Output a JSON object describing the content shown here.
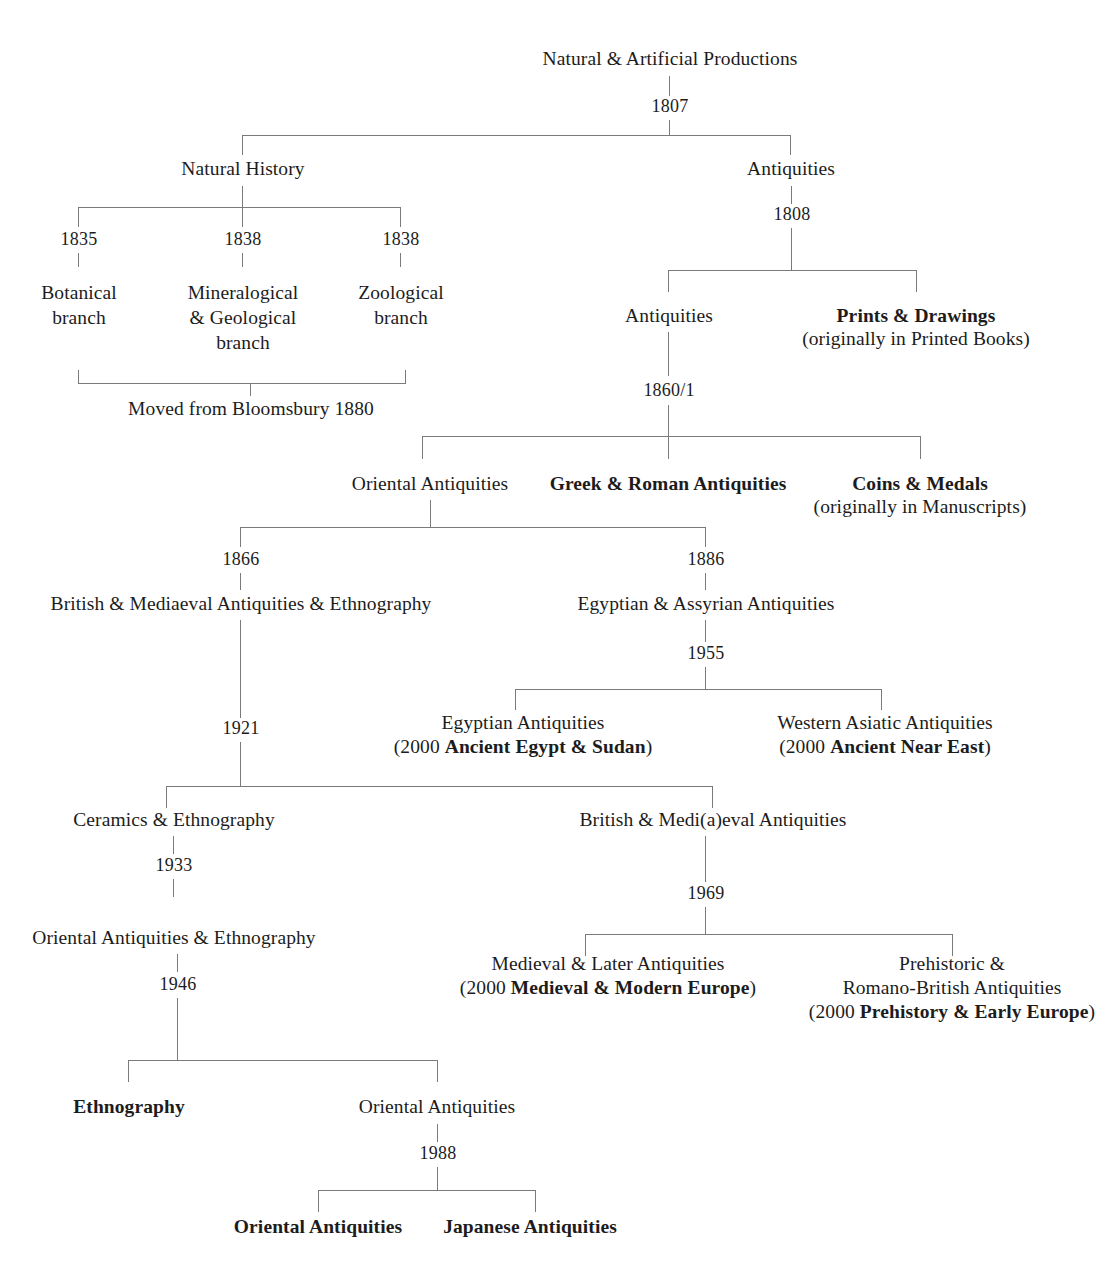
{
  "diagram": {
    "line_color": "#7a7a7a",
    "text_color": "#1c1c1c",
    "background": "#ffffff",
    "nodes": {
      "root": "Natural & Artificial Productions",
      "natural_history": "Natural History",
      "antiquities_1807": "Antiquities",
      "botanical": "Botanical\nbranch",
      "botanical_l1": "Botanical",
      "botanical_l2": "branch",
      "mineralogical_l1": "Mineralogical",
      "mineralogical_l2": "& Geological",
      "mineralogical_l3": "branch",
      "zoological_l1": "Zoological",
      "zoological_l2": "branch",
      "moved_bloomsbury": "Moved from Bloomsbury 1880",
      "antiquities_1808": "Antiquities",
      "prints_drawings": "Prints & Drawings",
      "prints_drawings_sub": "(originally in Printed Books)",
      "oriental_antiquities_1860": "Oriental Antiquities",
      "greek_roman": "Greek & Roman Antiquities",
      "coins_medals": "Coins & Medals",
      "coins_medals_sub": "(originally in Manuscripts)",
      "british_mediaeval_ethno": "British & Mediaeval Antiquities & Ethnography",
      "egyptian_assyrian": "Egyptian & Assyrian Antiquities",
      "egyptian_antiquities": "Egyptian Antiquities",
      "egyptian_antiquities_sub_pre": "(2000 ",
      "egyptian_antiquities_sub_bold": "Ancient Egypt & Sudan",
      "egyptian_antiquities_sub_post": ")",
      "western_asiatic": "Western Asiatic Antiquities",
      "western_asiatic_sub_pre": "(2000 ",
      "western_asiatic_sub_bold": "Ancient Near East",
      "western_asiatic_sub_post": ")",
      "ceramics_ethno": "Ceramics & Ethnography",
      "british_medieval": "British & Medi(a)eval Antiquities",
      "oriental_ethno": "Oriental Antiquities & Ethnography",
      "medieval_later": "Medieval & Later Antiquities",
      "medieval_later_sub_pre": "(2000 ",
      "medieval_later_sub_bold": "Medieval & Modern Europe",
      "medieval_later_sub_post": ")",
      "prehistoric_l1": "Prehistoric &",
      "prehistoric_l2": "Romano-British Antiquities",
      "prehistoric_sub_pre": "(2000 ",
      "prehistoric_sub_bold": "Prehistory & Early Europe",
      "prehistoric_sub_post": ")",
      "ethnography": "Ethnography",
      "oriental_antiquities_1946": "Oriental Antiquities",
      "oriental_antiquities_1988": "Oriental Antiquities",
      "japanese_antiquities": "Japanese Antiquities"
    },
    "years": {
      "y1807": "1807",
      "y1808": "1808",
      "y1835": "1835",
      "y1838a": "1838",
      "y1838b": "1838",
      "y1860": "1860/1",
      "y1866": "1866",
      "y1886": "1886",
      "y1921": "1921",
      "y1933": "1933",
      "y1946": "1946",
      "y1955": "1955",
      "y1969": "1969",
      "y1988": "1988"
    }
  }
}
